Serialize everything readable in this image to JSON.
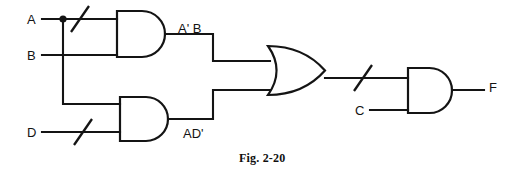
{
  "figure": {
    "caption": "Fig. 2-20",
    "caption_x": 239,
    "caption_y": 152,
    "background": "#ffffff",
    "ink": "#141414"
  },
  "labels": {
    "input_a": "A",
    "input_b": "B",
    "input_d": "D",
    "input_c": "C",
    "node_and1_out": "A' B",
    "node_and2_out": "AD'",
    "output_f": "F"
  },
  "label_positions": {
    "input_a": {
      "x": 27,
      "y": 13
    },
    "input_b": {
      "x": 27,
      "y": 49
    },
    "input_d": {
      "x": 27,
      "y": 126
    },
    "input_c": {
      "x": 355,
      "y": 104
    },
    "node_and1_out": {
      "x": 178,
      "y": 22
    },
    "node_and2_out": {
      "x": 183,
      "y": 127
    },
    "output_f": {
      "x": 489,
      "y": 81
    }
  },
  "gates": [
    {
      "name": "and-gate-1",
      "type": "AND",
      "x": 117,
      "y": 11,
      "w": 48,
      "h": 46,
      "output_label": "A' B"
    },
    {
      "name": "and-gate-2",
      "type": "AND",
      "x": 120,
      "y": 97,
      "w": 48,
      "h": 44,
      "output_label": "AD'"
    },
    {
      "name": "or-gate-1",
      "type": "OR",
      "x": 268,
      "y": 46,
      "w": 57,
      "h": 49,
      "output_label": ""
    },
    {
      "name": "and-gate-3",
      "type": "AND",
      "x": 408,
      "y": 68,
      "w": 44,
      "h": 45,
      "output_label": "F"
    }
  ],
  "inverter_slashes": [
    {
      "name": "inversion-slash-a",
      "cx": 80,
      "cy": 19
    },
    {
      "name": "inversion-slash-d",
      "cx": 83,
      "cy": 132
    },
    {
      "name": "inversion-slash-or-out",
      "cx": 363,
      "cy": 78
    }
  ],
  "junction_dots": [
    {
      "name": "junction-dot-a",
      "cx": 63,
      "cy": 19,
      "r": 3.6
    }
  ],
  "wires": [
    {
      "name": "wire-input-a",
      "d": "M 42 19 L 117 19"
    },
    {
      "name": "wire-input-b",
      "d": "M 42 55 L 117 55"
    },
    {
      "name": "wire-a-branch-to-and2",
      "d": "M 63 19 L 63 104 L 120 104"
    },
    {
      "name": "wire-input-d",
      "d": "M 42 132 L 120 132"
    },
    {
      "name": "wire-and1-out-to-or",
      "d": "M 165 34 L 213 34 L 213 61 L 270 61"
    },
    {
      "name": "wire-and2-out-to-or",
      "d": "M 168 119 L 213 119 L 213 90 L 270 90"
    },
    {
      "name": "wire-or-out-to-and3",
      "d": "M 325 78 L 408 78"
    },
    {
      "name": "wire-input-c",
      "d": "M 370 110 L 408 110"
    },
    {
      "name": "wire-and3-out-to-f",
      "d": "M 452 90 L 484 90"
    }
  ]
}
